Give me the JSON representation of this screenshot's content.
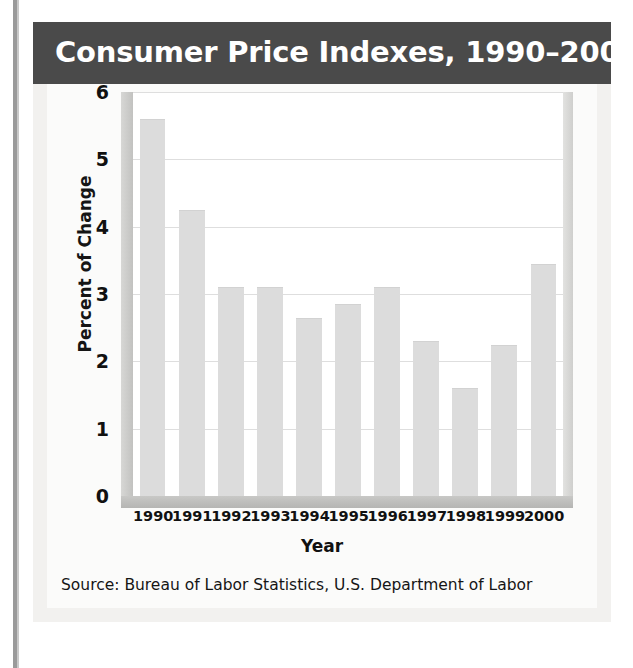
{
  "figure": {
    "title": "Consumer Price Indexes, 1990–2000",
    "source": "Source: Bureau of Labor Statistics, U.S. Department of Labor",
    "title_band_color": "#4a4a4a",
    "bar_color": "#dcdcdc",
    "gridline_color": "#dedede",
    "plot_background": "#ffffff",
    "card_background": "#f2f1ef"
  },
  "chart_data": {
    "type": "bar",
    "title": "Consumer Price Indexes, 1990–2000",
    "xlabel": "Year",
    "ylabel": "Percent of Change",
    "categories": [
      "1990",
      "1991",
      "1992",
      "1993",
      "1994",
      "1995",
      "1996",
      "1997",
      "1998",
      "1999",
      "2000"
    ],
    "values": [
      5.6,
      4.25,
      3.1,
      3.1,
      2.65,
      2.85,
      3.1,
      2.3,
      1.6,
      2.25,
      3.45
    ],
    "ylim": [
      0,
      6
    ],
    "yticks": [
      0,
      1,
      2,
      3,
      4,
      5,
      6
    ],
    "ytick_labels": [
      "0",
      "1",
      "2",
      "3",
      "4",
      "5",
      "6"
    ],
    "grid": true,
    "grid_axis": "y",
    "legend": false,
    "legend_position": "none",
    "annotations": [
      "Source: Bureau of Labor Statistics, U.S. Department of Labor"
    ]
  }
}
